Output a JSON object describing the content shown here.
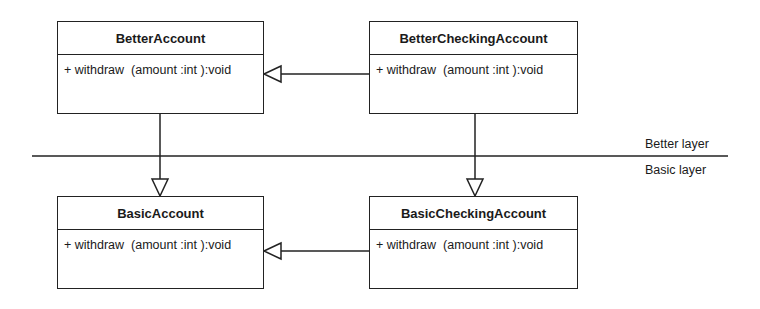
{
  "classes": {
    "better_account": {
      "name": "BetterAccount",
      "operation": "+ withdraw  (amount :int ):void"
    },
    "better_checking_account": {
      "name": "BetterCheckingAccount",
      "operation": "+ withdraw  (amount :int ):void"
    },
    "basic_account": {
      "name": "BasicAccount",
      "operation": "+ withdraw  (amount :int ):void"
    },
    "basic_checking_account": {
      "name": "BasicCheckingAccount",
      "operation": "+ withdraw  (amount :int ):void"
    }
  },
  "layers": {
    "upper": "Better layer",
    "lower": "Basic layer"
  },
  "relationships": [
    {
      "type": "generalization",
      "from": "BetterCheckingAccount",
      "to": "BetterAccount"
    },
    {
      "type": "generalization",
      "from": "BasicCheckingAccount",
      "to": "BasicAccount"
    },
    {
      "type": "generalization",
      "from": "BetterAccount",
      "to": "BasicAccount"
    },
    {
      "type": "generalization",
      "from": "BetterCheckingAccount",
      "to": "BasicCheckingAccount"
    }
  ]
}
